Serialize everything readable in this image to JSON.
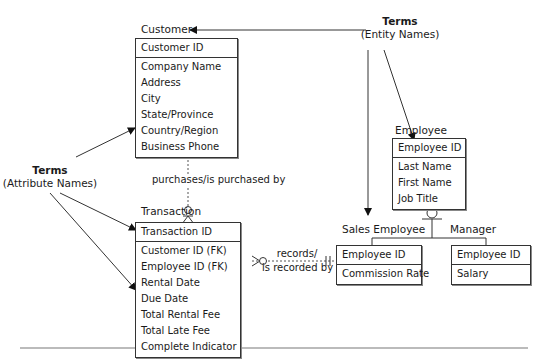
{
  "entities": {
    "customer": {
      "name": "Customer",
      "primary_key": "Customer ID",
      "attributes": [
        "Company Name",
        "Address",
        "City",
        "State/Province",
        "Country/Region",
        "Business Phone"
      ]
    },
    "transaction": {
      "name": "Transaction",
      "primary_key": "Transaction ID",
      "attributes": [
        "Customer ID (FK)",
        "Employee ID (FK)",
        "Rental Date",
        "Due Date",
        "Total Rental Fee",
        "Total Late Fee",
        "Complete Indicator"
      ]
    },
    "employee": {
      "name": "Employee",
      "primary_key": "Employee ID",
      "attributes": [
        "Last Name",
        "First Name",
        "Job Title"
      ]
    },
    "sales_employee": {
      "name": "Sales Employee",
      "primary_key": "Employee ID",
      "attributes": [
        "Commission Rate"
      ]
    },
    "manager": {
      "name": "Manager",
      "primary_key": "Employee ID",
      "attributes": [
        "Salary"
      ]
    }
  },
  "relationships": {
    "customer_transaction": "purchases/is purchased by",
    "transaction_sales_employee_line1": "records/",
    "transaction_sales_employee_line2": "is recorded by"
  },
  "annotations": {
    "entity_terms": {
      "title": "Terms",
      "subtitle": "(Entity Names)"
    },
    "attribute_terms": {
      "title": "Terms",
      "subtitle": "(Attribute Names)"
    }
  }
}
